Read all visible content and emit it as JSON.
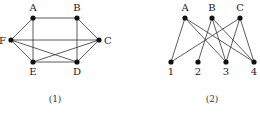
{
  "graphs": [
    {
      "caption": "(1)",
      "caption_pos": [
        55,
        102
      ],
      "nodes": [
        {
          "id": "A",
          "label": "A",
          "x": 33,
          "y": 18,
          "lx": 33,
          "ly": 11,
          "anchor": "middle"
        },
        {
          "id": "B",
          "label": "B",
          "x": 77,
          "y": 18,
          "lx": 77,
          "ly": 11,
          "anchor": "middle"
        },
        {
          "id": "C",
          "label": "C",
          "x": 99,
          "y": 40,
          "lx": 104,
          "ly": 44,
          "anchor": "start"
        },
        {
          "id": "D",
          "label": "D",
          "x": 77,
          "y": 62,
          "lx": 77,
          "ly": 75,
          "anchor": "middle"
        },
        {
          "id": "E",
          "label": "E",
          "x": 33,
          "y": 62,
          "lx": 33,
          "ly": 75,
          "anchor": "middle"
        },
        {
          "id": "F",
          "label": "F",
          "x": 11,
          "y": 40,
          "lx": 6,
          "ly": 44,
          "anchor": "end"
        }
      ],
      "edges": [
        [
          "A",
          "B"
        ],
        [
          "A",
          "F"
        ],
        [
          "A",
          "E"
        ],
        [
          "B",
          "C"
        ],
        [
          "B",
          "D"
        ],
        [
          "F",
          "C"
        ],
        [
          "F",
          "E"
        ],
        [
          "F",
          "D"
        ],
        [
          "C",
          "E"
        ],
        [
          "C",
          "D"
        ],
        [
          "E",
          "D"
        ]
      ]
    },
    {
      "caption": "(2)",
      "caption_pos": [
        212,
        102
      ],
      "nodes": [
        {
          "id": "A",
          "label": "A",
          "x": 185,
          "y": 18,
          "lx": 185,
          "ly": 11,
          "anchor": "middle"
        },
        {
          "id": "B",
          "label": "B",
          "x": 212,
          "y": 18,
          "lx": 212,
          "ly": 11,
          "anchor": "middle"
        },
        {
          "id": "C",
          "label": "C",
          "x": 240,
          "y": 18,
          "lx": 240,
          "ly": 11,
          "anchor": "middle"
        },
        {
          "id": "1",
          "label": "1",
          "x": 171,
          "y": 62,
          "lx": 171,
          "ly": 75,
          "anchor": "middle"
        },
        {
          "id": "2",
          "label": "2",
          "x": 198,
          "y": 62,
          "lx": 198,
          "ly": 75,
          "anchor": "middle"
        },
        {
          "id": "3",
          "label": "3",
          "x": 226,
          "y": 62,
          "lx": 226,
          "ly": 75,
          "anchor": "middle"
        },
        {
          "id": "4",
          "label": "4",
          "x": 254,
          "y": 62,
          "lx": 254,
          "ly": 75,
          "anchor": "middle"
        }
      ],
      "edges": [
        [
          "A",
          "1"
        ],
        [
          "A",
          "3"
        ],
        [
          "A",
          "4"
        ],
        [
          "B",
          "2"
        ],
        [
          "B",
          "3"
        ],
        [
          "B",
          "4"
        ],
        [
          "C",
          "1"
        ],
        [
          "C",
          "3"
        ],
        [
          "C",
          "4"
        ]
      ]
    }
  ]
}
